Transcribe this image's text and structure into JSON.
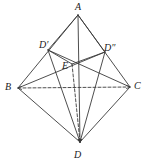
{
  "figure": {
    "background_color": "#ffffff",
    "stroke_color": "#3a3a3a",
    "label_color": "#1b1b1b",
    "canvas": {
      "width": 148,
      "height": 166
    },
    "labels": [
      {
        "id": "A",
        "text": "A",
        "x": 75,
        "y": 2
      },
      {
        "id": "Dp",
        "text": "D′",
        "x": 39,
        "y": 40
      },
      {
        "id": "Dpp",
        "text": "D″",
        "x": 104,
        "y": 43
      },
      {
        "id": "E",
        "text": "E",
        "x": 62,
        "y": 61
      },
      {
        "id": "B",
        "text": "B",
        "x": 5,
        "y": 82
      },
      {
        "id": "C",
        "text": "C",
        "x": 134,
        "y": 81
      },
      {
        "id": "D",
        "text": "D",
        "x": 74,
        "y": 150
      }
    ],
    "points": {
      "A": {
        "x": 78,
        "y": 15
      },
      "Dp": {
        "x": 48,
        "y": 50
      },
      "Dpp": {
        "x": 105,
        "y": 52
      },
      "E": {
        "x": 72,
        "y": 64
      },
      "B": {
        "x": 18,
        "y": 88
      },
      "C": {
        "x": 130,
        "y": 87
      },
      "D": {
        "x": 80,
        "y": 142
      }
    },
    "edges": [
      {
        "name": "A-B",
        "from": "A",
        "to": "B",
        "style": "solid"
      },
      {
        "name": "A-C",
        "from": "A",
        "to": "C",
        "style": "solid"
      },
      {
        "name": "A-Dp",
        "from": "A",
        "to": "Dp",
        "style": "solid"
      },
      {
        "name": "A-Dpp",
        "from": "A",
        "to": "Dpp",
        "style": "solid"
      },
      {
        "name": "A-D",
        "from": "A",
        "to": "D",
        "style": "solid"
      },
      {
        "name": "B-C",
        "from": "B",
        "to": "C",
        "style": "dashed",
        "arrows": "both"
      },
      {
        "name": "B-D",
        "from": "B",
        "to": "D",
        "style": "solid"
      },
      {
        "name": "C-D",
        "from": "C",
        "to": "D",
        "style": "solid"
      },
      {
        "name": "Dp-E",
        "from": "Dp",
        "to": "E",
        "style": "solid"
      },
      {
        "name": "Dpp-E",
        "from": "Dpp",
        "to": "E",
        "style": "solid"
      },
      {
        "name": "Dp-D",
        "from": "Dp",
        "to": "D",
        "style": "solid"
      },
      {
        "name": "Dpp-D",
        "from": "Dpp",
        "to": "D",
        "style": "solid"
      },
      {
        "name": "E-D",
        "from": "E",
        "to": "D",
        "style": "dashed"
      },
      {
        "name": "Dp-C",
        "from": "Dp",
        "to": "C",
        "style": "solid"
      },
      {
        "name": "Dpp-B",
        "from": "Dpp",
        "to": "B",
        "style": "solid"
      }
    ]
  }
}
